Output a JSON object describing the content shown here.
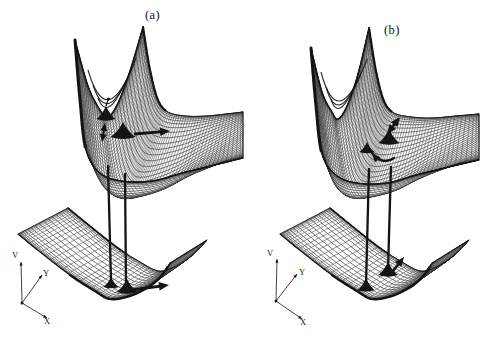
{
  "figure": {
    "type": "coupled-potential-energy-surfaces",
    "background": "#ffffff",
    "ink": "#141414",
    "panels": [
      {
        "label": "(a)",
        "axes": {
          "v_label": "V",
          "y_label": "Y",
          "x_label": "X",
          "origin": [
            22,
            303
          ],
          "v_end": [
            21,
            262
          ],
          "y_end": [
            42,
            275
          ],
          "x_end": [
            47,
            318
          ]
        },
        "upper_surface": {
          "kind": "upper",
          "rows": 40,
          "cols": 72,
          "left": [
            [
              75,
              40
            ],
            [
              88,
              86
            ],
            [
              100,
              110
            ],
            [
              107,
              118
            ],
            [
              117,
              105
            ],
            [
              129,
              74
            ],
            [
              143,
              27
            ]
          ],
          "right": [
            [
              243,
              158
            ],
            [
              243,
              134
            ],
            [
              243,
              112
            ]
          ],
          "front": [
            [
              75,
              40
            ],
            [
              80,
              100
            ],
            [
              86,
              150
            ],
            [
              100,
              173
            ],
            [
              122,
              181
            ],
            [
              152,
              181
            ],
            [
              182,
              173
            ],
            [
              215,
              165
            ],
            [
              243,
              158
            ]
          ],
          "back": [
            [
              143,
              27
            ],
            [
              150,
              70
            ],
            [
              158,
              100
            ],
            [
              168,
              112
            ],
            [
              186,
              116
            ],
            [
              206,
              116
            ],
            [
              226,
              114
            ],
            [
              243,
              112
            ]
          ],
          "arcs": [
            "M88 70 Q107 135 136 58",
            "M93 85 Q107 128 130 72",
            "M98 98 Q107 122 124 85"
          ]
        },
        "lower_surface": {
          "kind": "bowl",
          "rows": 22,
          "cols": 52,
          "front": [
            [
              18,
              234
            ],
            [
              40,
              252
            ],
            [
              70,
              275
            ],
            [
              95,
              291
            ],
            [
              110,
              299
            ],
            [
              130,
              296
            ],
            [
              150,
              286
            ],
            [
              162,
              275
            ],
            [
              170,
              263
            ]
          ],
          "back": [
            [
              68,
              208
            ],
            [
              90,
              226
            ],
            [
              118,
              248
            ],
            [
              140,
              262
            ],
            [
              158,
              271
            ],
            [
              172,
              268
            ],
            [
              186,
              260
            ],
            [
              198,
              250
            ],
            [
              207,
              240
            ]
          ]
        },
        "connectors": [
          [
            [
              108,
              165
            ],
            [
              111,
              281
            ]
          ],
          [
            [
              125,
              173
            ],
            [
              126,
              286
            ]
          ]
        ],
        "wavepackets": [
          {
            "cx": 106,
            "cy": 119,
            "w": 19,
            "h": 13,
            "stem": true
          },
          {
            "cx": 123,
            "cy": 137,
            "w": 25,
            "h": 15
          },
          {
            "cx": 111,
            "cy": 287,
            "w": 15,
            "h": 10
          },
          {
            "cx": 127,
            "cy": 292,
            "w": 21,
            "h": 13
          }
        ],
        "arrows": [
          {
            "kind": "double",
            "x1": 105,
            "y1": 123,
            "x2": 102,
            "y2": 142,
            "w": 2
          },
          {
            "kind": "single",
            "x1": 134,
            "y1": 134,
            "x2": 170,
            "y2": 131,
            "w": 2.8
          },
          {
            "kind": "single",
            "x1": 131,
            "y1": 290,
            "x2": 169,
            "y2": 285,
            "w": 2.8
          }
        ]
      },
      {
        "label": "(b)",
        "axes": {
          "v_label": "V",
          "y_label": "Y",
          "x_label": "X",
          "origin": [
            276,
            301
          ],
          "v_end": [
            277,
            259
          ],
          "y_end": [
            297,
            274
          ],
          "x_end": [
            302,
            319
          ]
        },
        "upper_surface": {
          "kind": "upper",
          "rows": 40,
          "cols": 72,
          "left": [
            [
              311,
              48
            ],
            [
              322,
              92
            ],
            [
              332,
              112
            ],
            [
              338,
              119
            ],
            [
              347,
              106
            ],
            [
              358,
              74
            ],
            [
              369,
              28
            ]
          ],
          "right": [
            [
              479,
              160
            ],
            [
              479,
              136
            ],
            [
              479,
              114
            ]
          ],
          "front": [
            [
              311,
              48
            ],
            [
              316,
              106
            ],
            [
              322,
              154
            ],
            [
              336,
              175
            ],
            [
              357,
              183
            ],
            [
              387,
              183
            ],
            [
              416,
              175
            ],
            [
              449,
              167
            ],
            [
              479,
              160
            ]
          ],
          "back": [
            [
              369,
              28
            ],
            [
              376,
              71
            ],
            [
              384,
              101
            ],
            [
              394,
              113
            ],
            [
              412,
              117
            ],
            [
              432,
              118
            ],
            [
              456,
              116
            ],
            [
              479,
              114
            ]
          ],
          "arcs": [
            "M321 72 Q338 136 367 59",
            "M326 87 Q338 129 361 73",
            "M331 99 Q338 123 355 86"
          ]
        },
        "lower_surface": {
          "kind": "bowl",
          "rows": 22,
          "cols": 52,
          "front": [
            [
              280,
              234
            ],
            [
              302,
              252
            ],
            [
              332,
              275
            ],
            [
              357,
              291
            ],
            [
              372,
              299
            ],
            [
              392,
              296
            ],
            [
              412,
              286
            ],
            [
              424,
              275
            ],
            [
              432,
              263
            ]
          ],
          "back": [
            [
              330,
              208
            ],
            [
              352,
              226
            ],
            [
              380,
              248
            ],
            [
              402,
              262
            ],
            [
              420,
              271
            ],
            [
              434,
              268
            ],
            [
              448,
              260
            ],
            [
              460,
              250
            ],
            [
              469,
              240
            ]
          ]
        },
        "connectors": [
          [
            [
              369,
              168
            ],
            [
              366,
              285
            ]
          ],
          [
            [
              391,
              166
            ],
            [
              388,
              270
            ]
          ]
        ],
        "wavepackets": [
          {
            "cx": 389,
            "cy": 143,
            "w": 21,
            "h": 14
          },
          {
            "cx": 367,
            "cy": 152,
            "w": 15,
            "h": 10
          },
          {
            "cx": 366,
            "cy": 290,
            "w": 17,
            "h": 12
          },
          {
            "cx": 388,
            "cy": 275,
            "w": 20,
            "h": 13
          }
        ],
        "arrows": [
          {
            "kind": "double",
            "x1": 387,
            "y1": 134,
            "x2": 400,
            "y2": 117,
            "w": 2.6
          },
          {
            "kind": "curved",
            "p": [
              [
                394,
                158
              ],
              [
                383,
                166
              ],
              [
                372,
                153
              ]
            ],
            "w": 2.4
          },
          {
            "kind": "single",
            "x1": 393,
            "y1": 271,
            "x2": 404,
            "y2": 257,
            "w": 2.6
          }
        ]
      }
    ]
  }
}
